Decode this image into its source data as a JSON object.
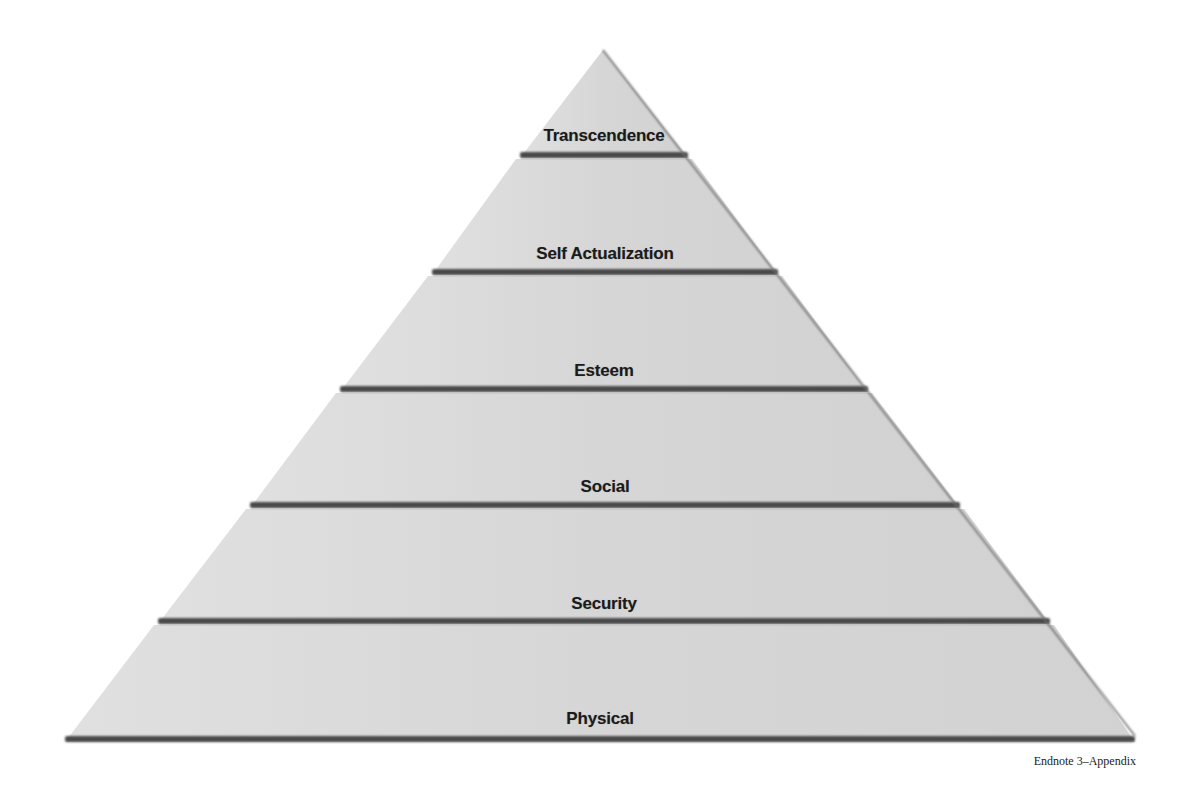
{
  "diagram": {
    "type": "pyramid",
    "title": "",
    "tiers_top_to_bottom": [
      {
        "label": "Transcendence",
        "band_y": 155,
        "band_left": 520,
        "band_right": 688,
        "label_y": 126
      },
      {
        "label": "Self Actualization",
        "band_y": 272,
        "band_left": 432,
        "band_right": 778,
        "label_y": 244
      },
      {
        "label": "Esteem",
        "band_y": 389,
        "band_left": 340,
        "band_right": 868,
        "label_y": 361
      },
      {
        "label": "Social",
        "band_y": 505,
        "band_left": 250,
        "band_right": 960,
        "label_y": 477
      },
      {
        "label": "Security",
        "band_y": 621,
        "band_left": 158,
        "band_right": 1050,
        "label_y": 594
      },
      {
        "label": "Physical",
        "band_y": 739,
        "band_left": 65,
        "band_right": 1135,
        "label_y": 709
      }
    ],
    "apex": {
      "x": 603,
      "y": 50
    },
    "base": {
      "left_x": 65,
      "right_x": 1135,
      "y": 739
    },
    "colors": {
      "fill": "#d8d8d8",
      "band": "#4a4a4a",
      "edge_shadow": "#6e6e6e",
      "label_text": "#1b1b1b"
    }
  },
  "caption": "Endnote 3–Appendix"
}
